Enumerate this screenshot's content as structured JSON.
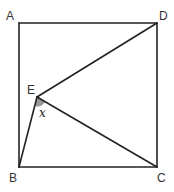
{
  "diagram": {
    "type": "geometry",
    "colors": {
      "line": "#222222",
      "label": "#333333",
      "angle_fill": "#9a9a9a",
      "background": "#ffffff"
    },
    "points": {
      "A": {
        "label": "A",
        "x": 19,
        "y": 23
      },
      "B": {
        "label": "B",
        "x": 19,
        "y": 167
      },
      "C": {
        "label": "C",
        "x": 157,
        "y": 167
      },
      "D": {
        "label": "D",
        "x": 157,
        "y": 23
      },
      "E": {
        "label": "E",
        "x": 37,
        "y": 97
      }
    },
    "segments": [
      [
        "A",
        "D"
      ],
      [
        "D",
        "C"
      ],
      [
        "C",
        "B"
      ],
      [
        "B",
        "A"
      ],
      [
        "E",
        "D"
      ],
      [
        "E",
        "C"
      ],
      [
        "E",
        "B"
      ]
    ],
    "angle": {
      "vertex": "E",
      "between": [
        "B",
        "C"
      ],
      "label": "x",
      "shaded": true
    }
  }
}
